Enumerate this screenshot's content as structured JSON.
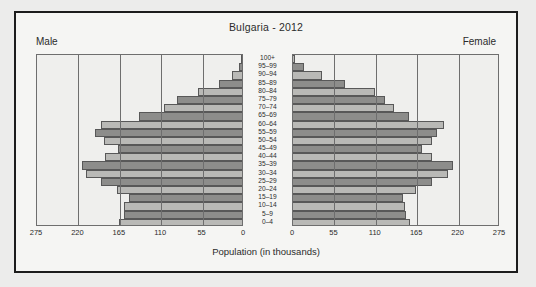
{
  "figure": {
    "title": "Bulgaria - 2012",
    "male_header": "Male",
    "female_header": "Female",
    "x_axis_title": "Population (in thousands)"
  },
  "chart_data": {
    "type": "bar",
    "subtype": "population-pyramid",
    "title": "Bulgaria - 2012",
    "xlabel": "Population (in thousands)",
    "ylabel": "",
    "xlim": [
      0,
      275
    ],
    "x_ticks_male": [
      "275",
      "220",
      "165",
      "110",
      "55",
      "0"
    ],
    "x_ticks_female": [
      "0",
      "55",
      "110",
      "165",
      "220",
      "275"
    ],
    "tick_values": [
      275,
      220,
      165,
      110,
      55,
      0
    ],
    "grid": true,
    "legend": [
      "Male",
      "Female"
    ],
    "legend_position": "top-corners",
    "units": "thousands",
    "categories": [
      "100+",
      "95-99",
      "90-94",
      "85-89",
      "80-84",
      "75-79",
      "70-74",
      "65-69",
      "60-64",
      "55-59",
      "50-54",
      "45-49",
      "40-44",
      "35-39",
      "30-34",
      "25-29",
      "20-24",
      "15-19",
      "10-14",
      "5-9",
      "0-4"
    ],
    "series": [
      {
        "name": "Male",
        "values": [
          1,
          4,
          13,
          30,
          59,
          87,
          104,
          137,
          188,
          195,
          183,
          165,
          182,
          213,
          207,
          188,
          166,
          150,
          157,
          157,
          163
        ]
      },
      {
        "name": "Female",
        "values": [
          3,
          14,
          39,
          69,
          109,
          122,
          134,
          154,
          200,
          191,
          184,
          172,
          185,
          213,
          206,
          185,
          163,
          146,
          149,
          150,
          155
        ]
      }
    ],
    "colors": {
      "bar_light": "#b9b9b6",
      "bar_dark": "#8d8d8b",
      "bar_outline": "#585858",
      "panel_background": "#efefed",
      "gridline": "#6e6e6e",
      "text": "#2b2b2b",
      "frame": "#1c1c1c",
      "page_background": "#ececeb"
    }
  }
}
